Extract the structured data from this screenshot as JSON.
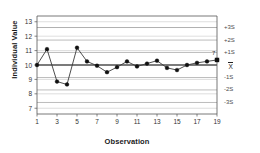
{
  "chart_data": {
    "type": "line",
    "title": "",
    "subtitle": "",
    "xlabel": "Observation",
    "ylabel": "Individual Value",
    "x": [
      1,
      2,
      3,
      4,
      5,
      6,
      7,
      8,
      9,
      10,
      11,
      12,
      13,
      14,
      15,
      16,
      17,
      18,
      19
    ],
    "values": [
      10.0,
      11.1,
      8.85,
      8.65,
      11.2,
      10.25,
      9.95,
      9.5,
      9.85,
      10.25,
      9.9,
      10.1,
      10.3,
      9.8,
      9.65,
      10.0,
      10.15,
      10.25,
      10.35
    ],
    "series": [
      {
        "name": "Individual Value",
        "values": [
          10.0,
          11.1,
          8.85,
          8.65,
          11.2,
          10.25,
          9.95,
          9.5,
          9.85,
          10.25,
          9.9,
          10.1,
          10.3,
          9.8,
          9.65,
          10.0,
          10.15,
          10.25,
          10.35
        ]
      }
    ],
    "xlim": [
      1,
      19
    ],
    "ylim": [
      6.6,
      13.4
    ],
    "ytick_values": [
      7,
      8,
      9,
      10,
      11,
      12,
      13
    ],
    "ytick_labels": [
      "7",
      "8",
      "9",
      "10",
      "11",
      "12",
      "13"
    ],
    "xtick_values": [
      1,
      3,
      5,
      7,
      9,
      11,
      13,
      15,
      17,
      19
    ],
    "xtick_labels": [
      "1",
      "3",
      "5",
      "7",
      "9",
      "11",
      "13",
      "15",
      "17",
      "19"
    ],
    "grid": true,
    "legend": false,
    "legend_position": "none",
    "control_limits": [
      {
        "label": "+3S",
        "value": 12.6,
        "style": "dark"
      },
      {
        "label": "+2S",
        "value": 11.73,
        "style": "light"
      },
      {
        "label": "+1S",
        "value": 10.87,
        "style": "light"
      },
      {
        "label": "X",
        "value": 10.0,
        "style": "center"
      },
      {
        "label": "-1S",
        "value": 9.13,
        "style": "light"
      },
      {
        "label": "-2S",
        "value": 8.27,
        "style": "light"
      },
      {
        "label": "-3S",
        "value": 7.4,
        "style": "light"
      }
    ],
    "annotations": [
      {
        "text": "7",
        "x": 19,
        "y": 10.85
      }
    ],
    "colors": {
      "line": "#3a3a3a",
      "marker": "#111111",
      "center_line": "#555555",
      "limit_line": "#8e8e8e",
      "grid": "#c8c8c8",
      "axis": "#555555",
      "text": "#1a1a1a"
    }
  }
}
